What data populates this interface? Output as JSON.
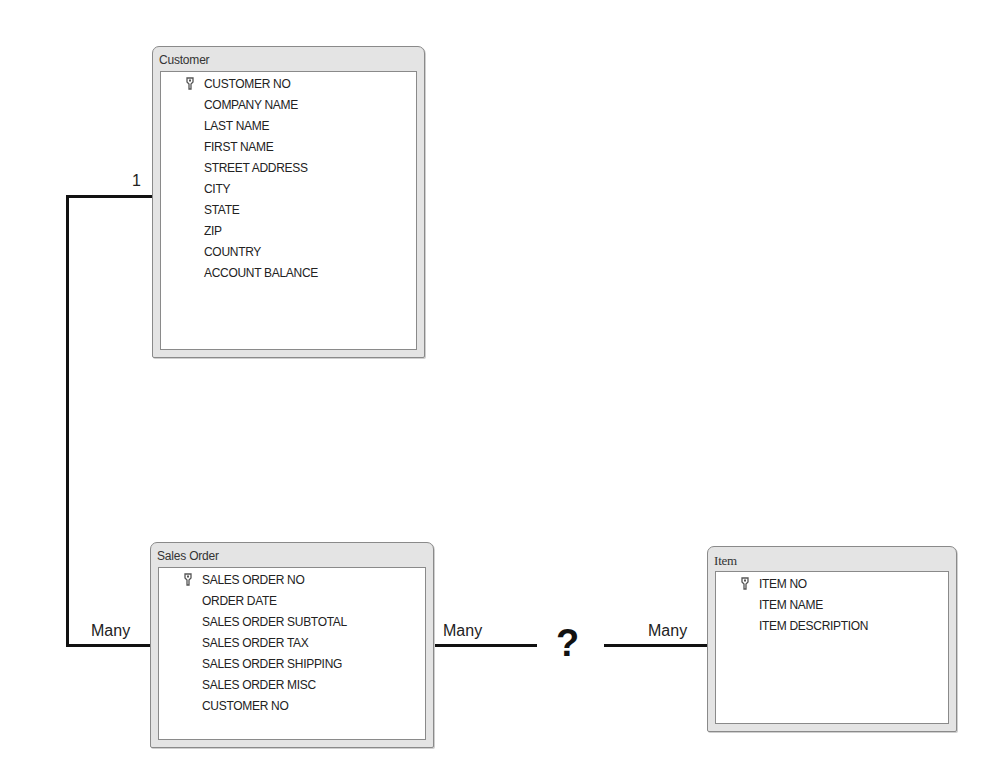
{
  "tables": {
    "customer": {
      "title": "Customer",
      "primary_key": "CUSTOMER NO",
      "fields": [
        "CUSTOMER NO",
        "COMPANY NAME",
        "LAST NAME",
        "FIRST NAME",
        "STREET ADDRESS",
        "CITY",
        "STATE",
        "ZIP",
        "COUNTRY",
        "ACCOUNT BALANCE"
      ]
    },
    "sales_order": {
      "title": "Sales Order",
      "primary_key": "SALES ORDER NO",
      "fields": [
        "SALES ORDER NO",
        "ORDER DATE",
        "SALES ORDER SUBTOTAL",
        "SALES ORDER TAX",
        "SALES ORDER SHIPPING",
        "SALES ORDER MISC",
        "CUSTOMER NO"
      ]
    },
    "item": {
      "title": "Item",
      "primary_key": "ITEM NO",
      "fields": [
        "ITEM NO",
        "ITEM NAME",
        "ITEM DESCRIPTION"
      ]
    }
  },
  "relationships": {
    "customer_sales_order": {
      "customer_side": "1",
      "sales_order_side": "Many"
    },
    "sales_order_item": {
      "sales_order_side": "Many",
      "item_side": "Many",
      "unknown_marker": "?"
    }
  },
  "icons": {
    "primary_key": "key-icon"
  }
}
